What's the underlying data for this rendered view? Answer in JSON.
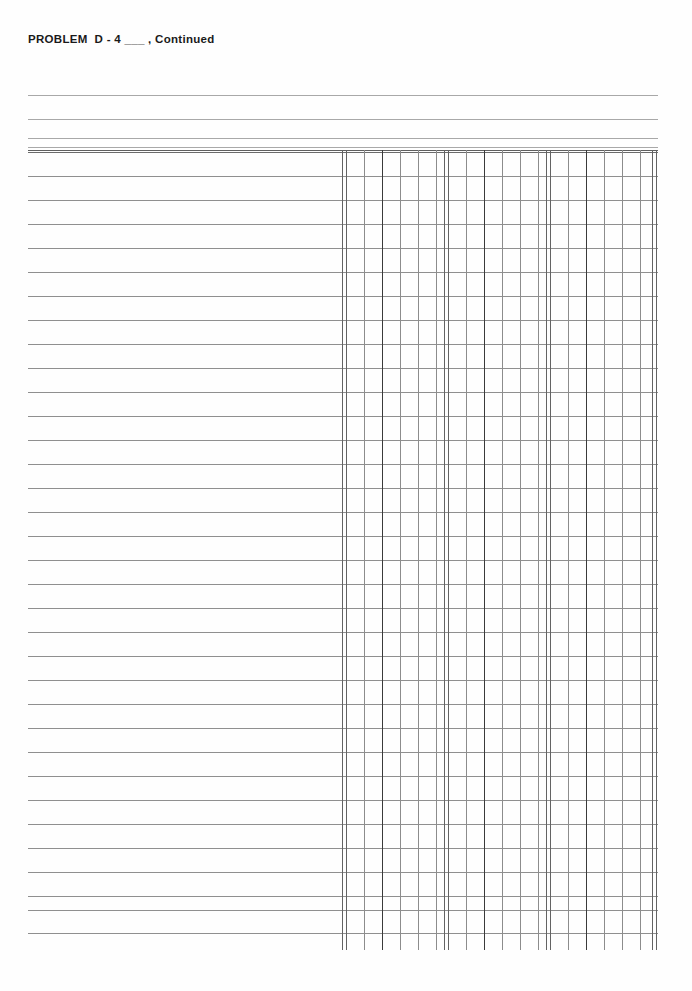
{
  "page": {
    "title": "PROBLEM  D - 4 ___ , Continued",
    "background_color": "#fefefe",
    "width": 692,
    "height": 991,
    "form_type": "accounting-ledger-worksheet",
    "ink_color": "#8c8c8c",
    "heavy_ink_color": "#3a3a3a",
    "text_color": "#1a1a1a"
  },
  "header": {
    "label": "PROBLEM  D - 4 ___ , Continued",
    "blank_fill_in": "___",
    "continued_marker": ", Continued",
    "rules": [
      {
        "name": "header-rule-1",
        "y": 95,
        "weight": "thin"
      },
      {
        "name": "header-rule-2",
        "y": 119,
        "weight": "thin"
      },
      {
        "name": "header-rule-3",
        "y": 138,
        "weight": "thin"
      },
      {
        "name": "header-rule-4",
        "y": 147,
        "weight": "thin"
      }
    ]
  },
  "ledger": {
    "left": 28,
    "right": 658,
    "top": 150,
    "bottom": 933,
    "rule_bottom_overhang": 950,
    "row_count": 33,
    "row_height": 24,
    "description_column": {
      "name": "description-area",
      "left": 28,
      "right": 342
    },
    "row_rules_y": [
      150,
      152,
      176,
      200,
      224,
      248,
      272,
      296,
      320,
      344,
      368,
      392,
      416,
      440,
      464,
      488,
      512,
      536,
      560,
      584,
      608,
      632,
      656,
      680,
      704,
      728,
      752,
      776,
      800,
      824,
      848,
      872,
      896,
      910,
      933
    ],
    "column_rules_x": [
      {
        "x": 342,
        "weight": "medium"
      },
      {
        "x": 346,
        "weight": "medium"
      },
      {
        "x": 364,
        "weight": "light"
      },
      {
        "x": 382,
        "weight": "thick"
      },
      {
        "x": 400,
        "weight": "light"
      },
      {
        "x": 418,
        "weight": "light"
      },
      {
        "x": 436,
        "weight": "light"
      },
      {
        "x": 444,
        "weight": "medium"
      },
      {
        "x": 448,
        "weight": "medium"
      },
      {
        "x": 466,
        "weight": "light"
      },
      {
        "x": 484,
        "weight": "thick"
      },
      {
        "x": 502,
        "weight": "light"
      },
      {
        "x": 520,
        "weight": "light"
      },
      {
        "x": 538,
        "weight": "light"
      },
      {
        "x": 546,
        "weight": "medium"
      },
      {
        "x": 550,
        "weight": "medium"
      },
      {
        "x": 568,
        "weight": "light"
      },
      {
        "x": 586,
        "weight": "thick"
      },
      {
        "x": 604,
        "weight": "light"
      },
      {
        "x": 622,
        "weight": "light"
      },
      {
        "x": 640,
        "weight": "light"
      },
      {
        "x": 652,
        "weight": "medium"
      },
      {
        "x": 656,
        "weight": "medium"
      }
    ],
    "column_groups": [
      {
        "name": "amount-column-group-1",
        "left": 342,
        "right": 444
      },
      {
        "name": "amount-column-group-2",
        "left": 444,
        "right": 546
      },
      {
        "name": "amount-column-group-3",
        "left": 546,
        "right": 658
      }
    ]
  }
}
